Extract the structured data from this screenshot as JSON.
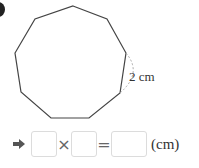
{
  "problem": {
    "shape": "nonagon",
    "side_length_label": "2 cm",
    "vertices": [
      [
        73,
        6
      ],
      [
        107,
        19
      ],
      [
        126,
        53
      ],
      [
        120,
        93
      ],
      [
        89,
        118
      ],
      [
        51,
        118
      ],
      [
        21,
        92
      ],
      [
        15,
        53
      ],
      [
        35,
        19
      ]
    ]
  },
  "equation": {
    "arrow_icon": "right-arrow-icon",
    "operator1": "×",
    "operator2": "=",
    "unit": "(cm)",
    "blanks": [
      "",
      "",
      ""
    ]
  },
  "colors": {
    "outline": "#444444",
    "dashed_arc": "#aaaaaa",
    "box_border": "#dcdcdc"
  }
}
